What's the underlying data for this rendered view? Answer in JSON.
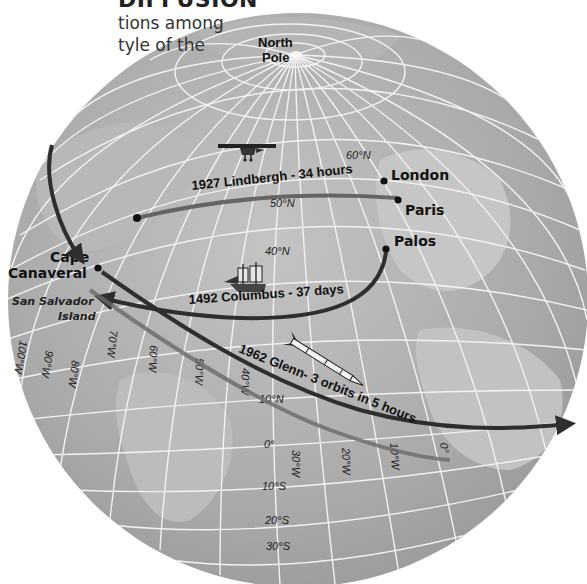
{
  "header": {
    "title": "DIFFUSION",
    "line1": "tions among",
    "line2": "tyle of the"
  },
  "map": {
    "pole_label_line1": "North",
    "pole_label_line2": "Pole",
    "colors": {
      "ocean": "#a9a9a9",
      "land": "#bdbdbd",
      "grid": "#f2f2f2",
      "route": "#2e2e2e",
      "route_light": "#6a6a6a",
      "dot": "#111111"
    },
    "cities": [
      {
        "name": "London"
      },
      {
        "name": "Paris"
      },
      {
        "name": "Palos"
      },
      {
        "name_line1": "Cape",
        "name_line2": "Canaveral"
      }
    ],
    "island": {
      "line1": "San Salvador",
      "line2": "Island"
    },
    "routes": [
      {
        "label": "1927 Lindbergh - 34 hours",
        "icon": "airplane-icon"
      },
      {
        "label": "1492 Columbus - 37 days",
        "icon": "sailing-ship-icon"
      },
      {
        "label": "1962 Glenn- 3 orbits in 5 hours",
        "icon": "rocket-icon"
      }
    ],
    "latitudes": [
      "60°N",
      "50°N",
      "40°N",
      "10°N",
      "0°",
      "10°S",
      "20°S",
      "30°S"
    ],
    "longitudes": [
      "100°W",
      "90°W",
      "80°W",
      "70°W",
      "60°W",
      "50°W",
      "40°W",
      "30°W",
      "20°W",
      "10°W",
      "0°"
    ]
  }
}
